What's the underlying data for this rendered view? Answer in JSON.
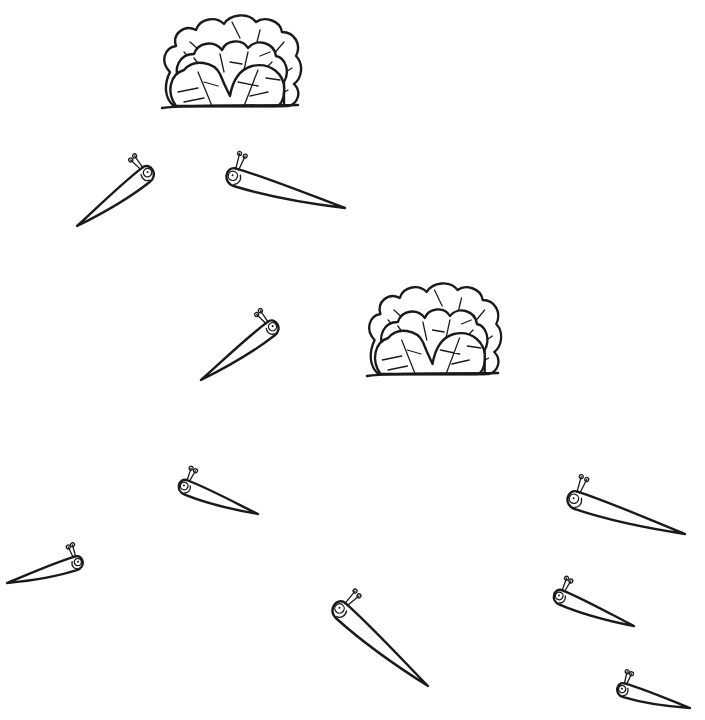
{
  "scene": {
    "title": "Lettuce bushes and slugs",
    "background": "#ffffff",
    "ink_color": "#1a1a1a",
    "bushes": [
      {
        "id": "bush-1",
        "x": 160,
        "y": 12,
        "width": 143,
        "height": 97
      },
      {
        "id": "bush-2",
        "x": 365,
        "y": 280,
        "width": 138,
        "height": 97
      }
    ],
    "slugs": [
      {
        "id": "slug-1",
        "head": [
          147,
          174
        ],
        "tail": [
          77,
          226
        ],
        "size": 1.0
      },
      {
        "id": "slug-2",
        "head": [
          234,
          177
        ],
        "tail": [
          345,
          208
        ],
        "size": 1.1
      },
      {
        "id": "slug-3",
        "head": [
          272,
          328
        ],
        "tail": [
          201,
          380
        ],
        "size": 0.95
      },
      {
        "id": "slug-4",
        "head": [
          185,
          487
        ],
        "tail": [
          258,
          514
        ],
        "size": 0.9
      },
      {
        "id": "slug-5",
        "head": [
          77,
          563
        ],
        "tail": [
          7,
          583
        ],
        "size": 0.85
      },
      {
        "id": "slug-6",
        "head": [
          575,
          500
        ],
        "tail": [
          685,
          534
        ],
        "size": 1.1
      },
      {
        "id": "slug-7",
        "head": [
          340,
          610
        ],
        "tail": [
          428,
          686
        ],
        "size": 1.1
      },
      {
        "id": "slug-8",
        "head": [
          560,
          597
        ],
        "tail": [
          634,
          626
        ],
        "size": 0.9
      },
      {
        "id": "slug-9",
        "head": [
          623,
          690
        ],
        "tail": [
          690,
          708
        ],
        "size": 0.85
      }
    ]
  }
}
